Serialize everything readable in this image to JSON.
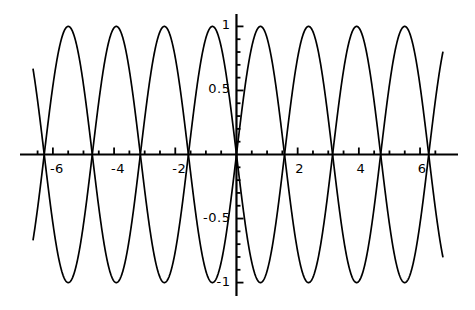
{
  "chart_data": {
    "type": "line",
    "title": "",
    "xlabel": "",
    "ylabel": "",
    "xlim": [
      -6.65,
      6.75
    ],
    "ylim": [
      -1.05,
      1.05
    ],
    "grid": false,
    "legend": "none",
    "axis_style": "cross-hair axes through origin with major and minor ticks",
    "xticks_major": [
      -6,
      -4,
      -2,
      2,
      4,
      6
    ],
    "xtick_labels": [
      "-6",
      "-4",
      "-2",
      "2",
      "4",
      "6"
    ],
    "xticks_minor": [
      -6.5,
      -5.5,
      -5,
      -4.5,
      -3.5,
      -3,
      -2.5,
      -1.5,
      -1,
      -0.5,
      0.5,
      1,
      1.5,
      2.5,
      3,
      3.5,
      4.5,
      5,
      5.5,
      6.5
    ],
    "yticks_major": [
      1,
      0.5,
      -0.5,
      -1
    ],
    "ytick_labels": [
      "1",
      "0.5",
      "-0.5",
      "-1"
    ],
    "yticks_minor": [
      0.9,
      0.8,
      0.7,
      0.6,
      0.4,
      0.3,
      0.2,
      0.1,
      -0.1,
      -0.2,
      -0.3,
      -0.4,
      -0.6,
      -0.7,
      -0.8,
      -0.9
    ],
    "series": [
      {
        "name": "sin(2x)",
        "expression": "sin(2*x)",
        "color": "#000000",
        "crossings": [
          -6.283,
          -4.712,
          -3.142,
          -1.571,
          0,
          1.571,
          3.142,
          4.712,
          6.283
        ],
        "maxima_x": [
          -5.498,
          -2.356,
          0.785,
          3.927
        ],
        "minima_x": [
          -3.927,
          -0.785,
          2.356,
          5.498
        ],
        "amplitude": 1,
        "period": 3.1416
      },
      {
        "name": "-sin(2x)",
        "expression": "-sin(2*x)",
        "color": "#000000",
        "crossings": [
          -6.283,
          -4.712,
          -3.142,
          -1.571,
          0,
          1.571,
          3.142,
          4.712,
          6.283
        ],
        "maxima_x": [
          -3.927,
          -0.785,
          2.356,
          5.498
        ],
        "minima_x": [
          -5.498,
          -2.356,
          0.785,
          3.927
        ],
        "amplitude": 1,
        "period": 3.1416
      }
    ],
    "colors": {
      "curve": "#000000",
      "axis": "#000000",
      "background": "#ffffff",
      "text": "#000000"
    }
  }
}
